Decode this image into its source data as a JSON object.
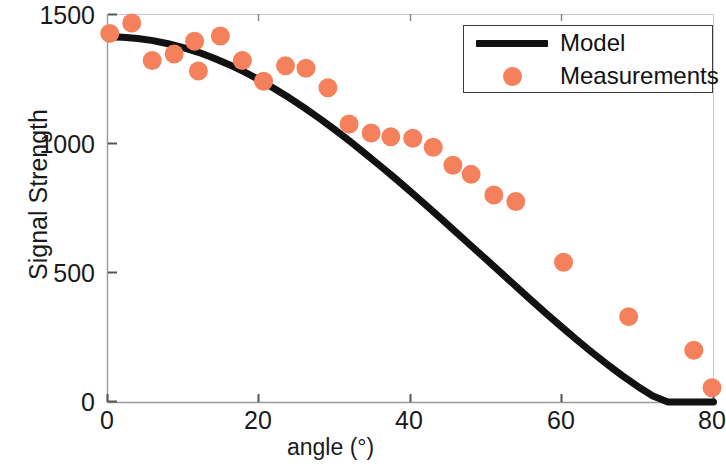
{
  "chart_data": {
    "type": "scatter",
    "title": "",
    "xlabel": "angle (°)",
    "ylabel": "Signal Strength",
    "xlim": [
      0,
      80
    ],
    "ylim": [
      0,
      1500
    ],
    "xticks": [
      0,
      20,
      40,
      60,
      80
    ],
    "yticks": [
      0,
      500,
      1000,
      1500
    ],
    "xtick_labels": [
      "0",
      "20",
      "40",
      "60",
      "80"
    ],
    "ytick_labels": [
      "0",
      "500",
      "1000",
      "1500"
    ],
    "grid": false,
    "legend_position": "upper right",
    "series": [
      {
        "name": "Model",
        "type": "line",
        "color": "#111111",
        "linewidth": 7,
        "x": [
          0,
          2,
          4,
          6,
          8,
          10,
          12,
          14,
          16,
          18,
          20,
          22,
          24,
          26,
          28,
          30,
          32,
          34,
          36,
          38,
          40,
          42,
          44,
          46,
          48,
          50,
          52,
          54,
          56,
          58,
          60,
          62,
          64,
          66,
          68,
          70,
          72,
          74,
          76,
          78,
          80
        ],
        "y": [
          1412,
          1410,
          1405,
          1397,
          1385,
          1370,
          1352,
          1330,
          1305,
          1277,
          1246,
          1212,
          1176,
          1137,
          1096,
          1053,
          1008,
          961,
          913,
          864,
          813,
          762,
          710,
          657,
          604,
          551,
          498,
          445,
          392,
          340,
          289,
          239,
          191,
          145,
          101,
          60,
          23,
          0,
          0,
          0,
          0
        ]
      },
      {
        "name": "Measurements",
        "type": "scatter",
        "color": "#f4815c",
        "marker": "circle",
        "markersize": 19,
        "x": [
          0.3,
          3.2,
          5.9,
          8.8,
          11.5,
          12.0,
          14.9,
          17.8,
          20.6,
          23.5,
          26.2,
          29.1,
          31.9,
          34.8,
          37.4,
          40.3,
          43.0,
          45.6,
          48.0,
          51.0,
          53.9,
          60.2,
          68.8,
          77.4,
          79.8
        ],
        "y": [
          1425,
          1465,
          1320,
          1345,
          1395,
          1280,
          1415,
          1320,
          1240,
          1300,
          1290,
          1215,
          1075,
          1040,
          1025,
          1020,
          985,
          915,
          880,
          800,
          775,
          540,
          330,
          200,
          55
        ]
      }
    ]
  },
  "legend": {
    "items": [
      {
        "label": "Model",
        "symbol": "line",
        "color": "#111111"
      },
      {
        "label": "Measurements",
        "symbol": "dot",
        "color": "#f4815c"
      }
    ]
  },
  "axes": {
    "x_label": "angle (°)",
    "y_label": "Signal Strength",
    "x_tick_labels": [
      "0",
      "20",
      "40",
      "60",
      "80"
    ],
    "y_tick_labels": [
      "0",
      "500",
      "1000",
      "1500"
    ]
  },
  "colors": {
    "measurement_orange": "#f4815c",
    "model_black": "#111111",
    "axis_gray": "#9a9a9a",
    "background": "#ffffff"
  }
}
